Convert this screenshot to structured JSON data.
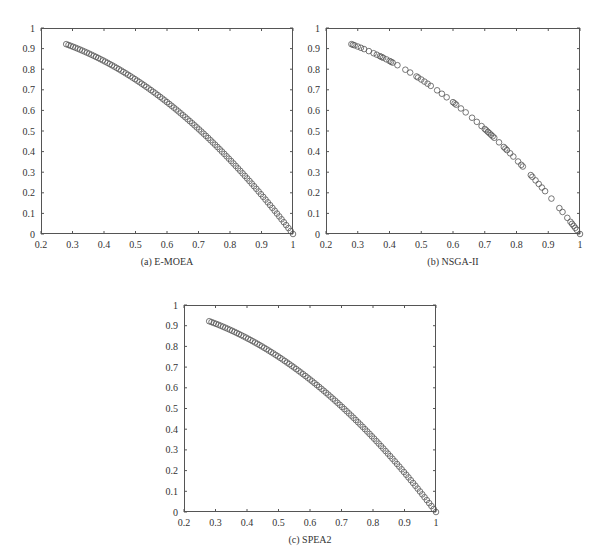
{
  "figure": {
    "panels": [
      {
        "id": "a",
        "caption": "(a)  E-MOEA",
        "box": {
          "left": 41,
          "top": 28,
          "right": 293,
          "bottom": 234
        }
      },
      {
        "id": "b",
        "caption": "(b)  NSGA-II",
        "box": {
          "left": 326,
          "top": 28,
          "right": 580,
          "bottom": 234
        }
      },
      {
        "id": "c",
        "caption": "(c)  SPEA2",
        "box": {
          "left": 184,
          "top": 305,
          "right": 436,
          "bottom": 512
        }
      }
    ]
  },
  "chart_data": [
    {
      "type": "scatter",
      "title": "(a) E-MOEA",
      "xlabel": "",
      "ylabel": "",
      "xlim": [
        0.2,
        1
      ],
      "ylim": [
        0,
        1
      ],
      "xticks": [
        "0.2",
        "0.3",
        "0.4",
        "0.5",
        "0.6",
        "0.7",
        "0.8",
        "0.9",
        "1"
      ],
      "yticks": [
        "0",
        "0.1",
        "0.2",
        "0.3",
        "0.4",
        "0.5",
        "0.6",
        "0.7",
        "0.8",
        "0.9",
        "1"
      ],
      "grid": false,
      "marker": "open-circle",
      "marker_color": "#555555",
      "series": [
        {
          "name": "E-MOEA",
          "x_range": [
            0.28,
            1.0
          ],
          "count": 100,
          "relation": "y = 1 - x^2",
          "x": [],
          "y": []
        }
      ]
    },
    {
      "type": "scatter",
      "title": "(b) NSGA-II",
      "xlabel": "",
      "ylabel": "",
      "xlim": [
        0.2,
        1
      ],
      "ylim": [
        0,
        1
      ],
      "xticks": [
        "0.2",
        "0.3",
        "0.4",
        "0.5",
        "0.6",
        "0.7",
        "0.8",
        "0.9",
        "1"
      ],
      "yticks": [
        "0",
        "0.1",
        "0.2",
        "0.3",
        "0.4",
        "0.5",
        "0.6",
        "0.7",
        "0.8",
        "0.9",
        "1"
      ],
      "grid": false,
      "marker": "open-circle",
      "marker_color": "#555555",
      "series": [
        {
          "name": "NSGA-II",
          "relation": "y = 1 - x^2",
          "x": [
            0.28,
            0.285,
            0.29,
            0.3,
            0.31,
            0.32,
            0.335,
            0.35,
            0.36,
            0.37,
            0.375,
            0.38,
            0.39,
            0.4,
            0.405,
            0.41,
            0.425,
            0.45,
            0.465,
            0.485,
            0.49,
            0.5,
            0.51,
            0.52,
            0.53,
            0.55,
            0.565,
            0.58,
            0.6,
            0.605,
            0.61,
            0.625,
            0.64,
            0.66,
            0.675,
            0.69,
            0.7,
            0.705,
            0.71,
            0.715,
            0.72,
            0.725,
            0.73,
            0.745,
            0.76,
            0.765,
            0.77,
            0.78,
            0.79,
            0.805,
            0.815,
            0.82,
            0.845,
            0.85,
            0.86,
            0.87,
            0.88,
            0.89,
            0.91,
            0.935,
            0.945,
            0.96,
            0.97,
            0.975,
            0.98,
            0.985,
            0.99,
            1.0
          ],
          "y": []
        }
      ]
    },
    {
      "type": "scatter",
      "title": "(c) SPEA2",
      "xlabel": "",
      "ylabel": "",
      "xlim": [
        0.2,
        1
      ],
      "ylim": [
        0,
        1
      ],
      "xticks": [
        "0.2",
        "0.3",
        "0.4",
        "0.5",
        "0.6",
        "0.7",
        "0.8",
        "0.9",
        "1"
      ],
      "yticks": [
        "0",
        "0.1",
        "0.2",
        "0.3",
        "0.4",
        "0.5",
        "0.6",
        "0.7",
        "0.8",
        "0.9",
        "1"
      ],
      "grid": false,
      "marker": "open-circle",
      "marker_color": "#555555",
      "series": [
        {
          "name": "SPEA2",
          "x_range": [
            0.28,
            1.0
          ],
          "count": 100,
          "relation": "y = 1 - x^2",
          "x": [],
          "y": []
        }
      ]
    }
  ]
}
